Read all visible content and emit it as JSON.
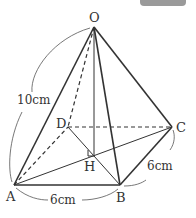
{
  "figure": {
    "type": "square pyramid",
    "vertices": {
      "O": {
        "label": "O",
        "x": 94,
        "y": 27
      },
      "A": {
        "label": "A",
        "x": 14,
        "y": 185
      },
      "B": {
        "label": "B",
        "x": 120,
        "y": 185
      },
      "C": {
        "label": "C",
        "x": 172,
        "y": 127
      },
      "D": {
        "label": "D",
        "x": 68,
        "y": 127
      },
      "H": {
        "label": "H",
        "x": 93,
        "y": 153
      }
    },
    "dimensions": {
      "OA": "10cm",
      "AB": "6cm",
      "BC": "6cm"
    },
    "colors": {
      "line": "#333333",
      "badge": "#9a9a9a"
    }
  }
}
